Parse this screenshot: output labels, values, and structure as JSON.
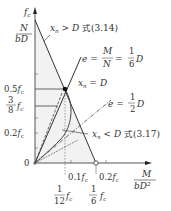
{
  "diagram": {
    "type": "interaction-diagram",
    "y_axis": {
      "label_top": "f",
      "label_top_sub": "c",
      "label_fraction_num": "N",
      "label_fraction_den": "bD",
      "ticks": [
        {
          "label": "0.5",
          "unit": "f",
          "sub": "c"
        },
        {
          "label_num": "3",
          "label_den": "8",
          "unit": "f",
          "sub": "c"
        },
        {
          "label": "0.2",
          "unit": "f",
          "sub": "c"
        }
      ],
      "origin": "0"
    },
    "x_axis": {
      "label_num": "M",
      "label_den": "bD²",
      "ticks": [
        {
          "label": "0.1",
          "unit": "f",
          "sub": "c"
        },
        {
          "label": "0.2",
          "unit": "f",
          "sub": "c"
        }
      ],
      "below_ticks": [
        {
          "num": "1",
          "den": "12",
          "unit": "f",
          "sub": "c"
        },
        {
          "num": "1",
          "den": "6",
          "unit": "f",
          "sub": "c"
        }
      ]
    },
    "annotations": {
      "xn_gt_D": {
        "var": "x",
        "sub": "n",
        "rel": " > D ",
        "jp": "式",
        "ref": "(3.14)"
      },
      "e_sixth": {
        "var": "e",
        "eq1": " = ",
        "frac1_num": "M",
        "frac1_den": "N",
        "eq2": " = ",
        "frac2_num": "1",
        "frac2_den": "6",
        "tail": "D"
      },
      "xn_eq_D": {
        "var": "x",
        "sub": "n",
        "rel": " = D"
      },
      "e_half": {
        "var": "e",
        "eq": " = ",
        "frac_num": "1",
        "frac_den": "2",
        "tail": "D"
      },
      "xn_lt_D": {
        "var": "x",
        "sub": "n",
        "rel": " < D ",
        "jp": "式",
        "ref": "(3.17)"
      }
    },
    "colors": {
      "line": "#333333",
      "shade": "#f1f1f1",
      "axis": "#555555"
    }
  }
}
